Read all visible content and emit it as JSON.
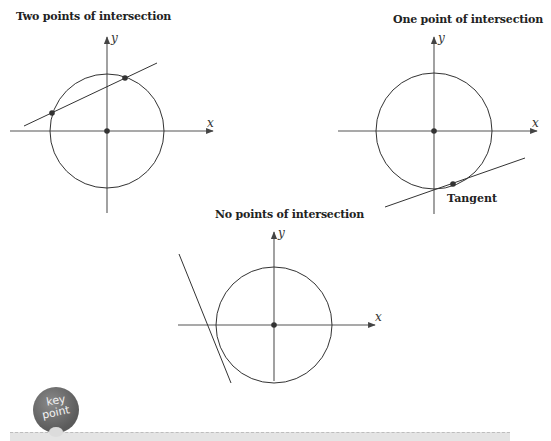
{
  "figures": [
    {
      "id": "two-points",
      "title": "Two points of intersection",
      "x_label": "x",
      "y_label": "y",
      "intersection_count": 2
    },
    {
      "id": "one-point",
      "title": "One point of intersection",
      "x_label": "x",
      "y_label": "y",
      "intersection_count": 1,
      "line_label": "Tangent"
    },
    {
      "id": "no-points",
      "title": "No points of intersection",
      "x_label": "x",
      "y_label": "y",
      "intersection_count": 0
    }
  ],
  "key_point": {
    "line1": "key",
    "line2": "point"
  },
  "colors": {
    "stroke": "#333333",
    "point": "#333333",
    "badge": "#6a6a6a",
    "bar": "#e4e4e4"
  }
}
